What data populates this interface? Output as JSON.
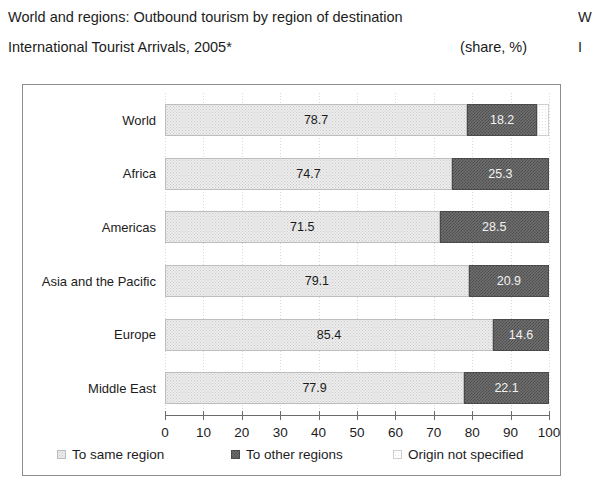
{
  "heading": {
    "line1": "World and regions: Outbound tourism by region of destination",
    "line2": "International Tourist Arrivals, 2005*",
    "unit": "(share, %)"
  },
  "right_bleed": {
    "line1": "W",
    "line2": "I"
  },
  "legend": [
    {
      "label": "To same region",
      "swatch": "light-stipple"
    },
    {
      "label": "To other regions",
      "swatch": "dark-checker"
    },
    {
      "label": "Origin not specified",
      "swatch": "white-outline"
    }
  ],
  "chart_data": {
    "type": "bar",
    "orientation": "horizontal",
    "stacked": true,
    "title": "World and regions: Outbound tourism by region of destination",
    "subtitle": "International Tourist Arrivals, 2005*",
    "xlabel": "",
    "ylabel": "",
    "unit": "(share, %)",
    "xlim": [
      0,
      100
    ],
    "xticks": [
      0,
      10,
      20,
      30,
      40,
      50,
      60,
      70,
      80,
      90,
      100
    ],
    "grid": true,
    "legend_position": "bottom",
    "categories": [
      "World",
      "Africa",
      "Americas",
      "Asia and the Pacific",
      "Europe",
      "Middle East"
    ],
    "series": [
      {
        "name": "To same region",
        "values": [
          78.7,
          74.7,
          71.5,
          79.1,
          85.4,
          77.9
        ]
      },
      {
        "name": "To other regions",
        "values": [
          18.2,
          25.3,
          28.5,
          20.9,
          14.6,
          22.1
        ]
      },
      {
        "name": "Origin not specified",
        "values": [
          3.1,
          0.0,
          0.0,
          0.0,
          0.0,
          0.0
        ]
      }
    ]
  }
}
